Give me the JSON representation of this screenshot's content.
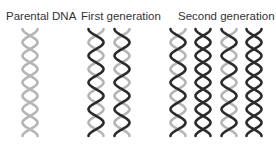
{
  "labels": {
    "parental": "Parental DNA",
    "first": "First generation",
    "second": "Second generation"
  },
  "colors": {
    "old_strand": "#b5b5b5",
    "new_strand": "#2b2b2b",
    "text": "#333333"
  },
  "helix_geometry": {
    "top_y": 29,
    "bottom_y": 136,
    "width": 15,
    "half_turns": 8,
    "stroke_width": 2.6
  },
  "groups": [
    {
      "name": "Parental DNA",
      "helices": [
        {
          "center_x": 30,
          "strand_a": "old",
          "strand_b": "old"
        }
      ]
    },
    {
      "name": "First generation",
      "helices": [
        {
          "center_x": 96,
          "strand_a": "new",
          "strand_b": "old"
        },
        {
          "center_x": 122,
          "strand_a": "new",
          "strand_b": "old"
        }
      ]
    },
    {
      "name": "Second generation",
      "helices": [
        {
          "center_x": 178,
          "strand_a": "new",
          "strand_b": "old"
        },
        {
          "center_x": 203,
          "strand_a": "new",
          "strand_b": "new"
        },
        {
          "center_x": 229,
          "strand_a": "new",
          "strand_b": "old"
        },
        {
          "center_x": 254,
          "strand_a": "new",
          "strand_b": "new"
        }
      ]
    }
  ]
}
